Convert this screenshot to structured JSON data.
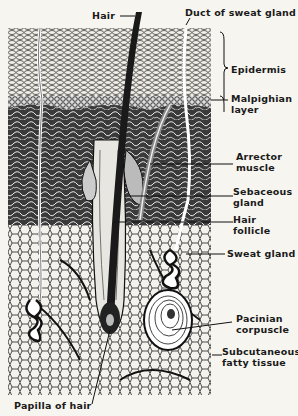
{
  "diagram": {
    "labels": {
      "hair": "Hair",
      "duct": "Duct of sweat gland",
      "epidermis": "Epidermis",
      "malpighian_1": "Malpighian",
      "malpighian_2": "layer",
      "arrector_1": "Arrector",
      "arrector_2": "muscle",
      "sebaceous_1": "Sebaceous",
      "sebaceous_2": "gland",
      "follicle_1": "Hair",
      "follicle_2": "follicle",
      "sweat_gland": "Sweat gland",
      "pacinian_1": "Pacinian",
      "pacinian_2": "corpuscle",
      "subcut_1": "Subcutaneous",
      "subcut_2": "fatty tissue",
      "papilla": "Papilla of hair"
    },
    "colors": {
      "ink": "#1a1a1a",
      "paper": "#f7f5f0"
    }
  }
}
